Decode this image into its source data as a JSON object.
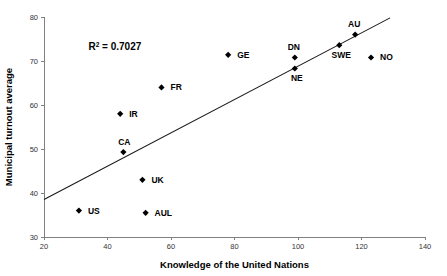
{
  "chart_data": {
    "type": "scatter",
    "title": "",
    "xlabel": "Knowledge of the United Nations",
    "ylabel": "Municipal turnout average",
    "xlim": [
      20,
      140
    ],
    "ylim": [
      30,
      80
    ],
    "xticks": [
      20,
      40,
      60,
      80,
      100,
      120,
      140
    ],
    "yticks": [
      30,
      40,
      50,
      60,
      70,
      80
    ],
    "xtick_labels": [
      "20",
      "40",
      "60",
      "80",
      "100",
      "120",
      "140"
    ],
    "ytick_labels": [
      "30",
      "40",
      "50",
      "60",
      "70",
      "80"
    ],
    "grid": false,
    "legend": null,
    "annotations": [
      {
        "name": "r-squared",
        "text": "R2 = 0.7027",
        "base": "R",
        "superscript": "2",
        "rest": " = 0.7027",
        "x": 34,
        "y": 72.5
      }
    ],
    "points": [
      {
        "label": "US",
        "x": 31,
        "y": 36.0,
        "label_dx": 9,
        "label_dy": 3
      },
      {
        "label": "IR",
        "x": 44,
        "y": 58.0,
        "label_dx": 9,
        "label_dy": 3
      },
      {
        "label": "CA",
        "x": 45,
        "y": 49.3,
        "label_dx": 1,
        "label_dy": -7
      },
      {
        "label": "UK",
        "x": 51,
        "y": 43.0,
        "label_dx": 9,
        "label_dy": 3
      },
      {
        "label": "AUL",
        "x": 52,
        "y": 35.5,
        "label_dx": 9,
        "label_dy": 3
      },
      {
        "label": "FR",
        "x": 57,
        "y": 64.0,
        "label_dx": 9,
        "label_dy": 3
      },
      {
        "label": "GE",
        "x": 78,
        "y": 71.4,
        "label_dx": 9,
        "label_dy": 3
      },
      {
        "label": "NE",
        "x": 99,
        "y": 68.3,
        "label_dx": 2,
        "label_dy": 13
      },
      {
        "label": "DN",
        "x": 99,
        "y": 70.8,
        "label_dx": -1,
        "label_dy": -7
      },
      {
        "label": "SWE",
        "x": 113,
        "y": 73.6,
        "label_dx": 2,
        "label_dy": 13
      },
      {
        "label": "AU",
        "x": 118,
        "y": 76.0,
        "label_dx": -1,
        "label_dy": -8
      },
      {
        "label": "NO",
        "x": 123,
        "y": 70.8,
        "label_dx": 9,
        "label_dy": 3
      }
    ],
    "trendline": {
      "name": "linear-fit",
      "x0": 20,
      "y0": 38.5,
      "x1": 129,
      "y1": 79.8,
      "r_squared": 0.7027
    },
    "colors": {
      "marker": "#000000",
      "trendline": "#1a1a1a",
      "axis": "#808080",
      "text": "#000000",
      "background": "#ffffff"
    }
  }
}
